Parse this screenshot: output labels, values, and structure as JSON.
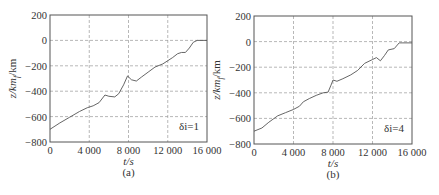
{
  "chart_data": [
    {
      "type": "line",
      "panel_label": "(a)",
      "annotation": "δi=1",
      "xlabel": "t/s",
      "ylabel": "z_f/km",
      "xlim": [
        0,
        16000
      ],
      "ylim": [
        -800,
        200
      ],
      "xticks": [
        0,
        4000,
        8000,
        12000,
        16000
      ],
      "xtick_labels": [
        "0",
        "4 000",
        "8 000",
        "12 000",
        "16 000"
      ],
      "yticks": [
        200,
        0,
        -200,
        -400,
        -600,
        -800
      ],
      "ytick_labels": [
        "200",
        "0",
        "-200",
        "-400",
        "-600",
        "-800"
      ],
      "grid": true,
      "series": [
        {
          "name": "z_f",
          "x": [
            0,
            1000,
            2000,
            3000,
            3800,
            4400,
            5000,
            5600,
            6000,
            6600,
            7000,
            7500,
            7900,
            8300,
            8800,
            9300,
            10000,
            10700,
            11500,
            12000,
            12500,
            13000,
            13400,
            13800,
            14200,
            14600,
            15000,
            16000
          ],
          "y": [
            -700,
            -650,
            -605,
            -560,
            -530,
            -515,
            -490,
            -430,
            -440,
            -445,
            -420,
            -350,
            -280,
            -310,
            -320,
            -290,
            -250,
            -210,
            -185,
            -160,
            -135,
            -105,
            -95,
            -95,
            -60,
            -15,
            0,
            0
          ]
        }
      ]
    },
    {
      "type": "line",
      "panel_label": "(b)",
      "annotation": "δi=4",
      "xlabel": "t/s",
      "ylabel": "z_f/km",
      "xlim": [
        0,
        16000
      ],
      "ylim": [
        -800,
        200
      ],
      "xticks": [
        0,
        4000,
        8000,
        12000,
        16000
      ],
      "xtick_labels": [
        "0",
        "4 000",
        "8 000",
        "12 000",
        "16 000"
      ],
      "yticks": [
        200,
        0,
        -200,
        -400,
        -600,
        -800
      ],
      "ytick_labels": [
        "200",
        "0",
        "-200",
        "-400",
        "-600",
        "-800"
      ],
      "grid": true,
      "series": [
        {
          "name": "z_f",
          "x": [
            0,
            800,
            1500,
            2400,
            3200,
            4000,
            4600,
            5000,
            5600,
            6300,
            7000,
            7500,
            7800,
            8000,
            8400,
            9000,
            9800,
            10500,
            11200,
            12000,
            12400,
            12800,
            13200,
            13600,
            14200,
            14700,
            15000,
            16000
          ],
          "y": [
            -700,
            -675,
            -630,
            -580,
            -555,
            -530,
            -505,
            -470,
            -445,
            -420,
            -400,
            -395,
            -340,
            -300,
            -310,
            -290,
            -260,
            -225,
            -170,
            -140,
            -125,
            -150,
            -110,
            -65,
            -55,
            -10,
            -10,
            -10
          ]
        }
      ]
    }
  ]
}
